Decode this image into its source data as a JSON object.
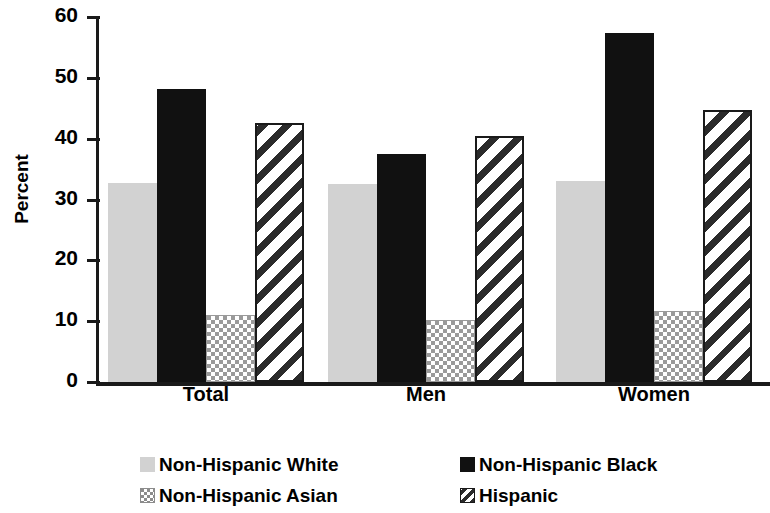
{
  "chart_data": {
    "type": "bar",
    "title": "",
    "xlabel": "",
    "ylabel": "Percent",
    "ylim": [
      0,
      60
    ],
    "yticks": [
      0,
      10,
      20,
      30,
      40,
      50,
      60
    ],
    "ytick_labels": [
      "0",
      "10",
      "20",
      "30",
      "40",
      "50",
      "60"
    ],
    "categories": [
      "Total",
      "Men",
      "Women"
    ],
    "grid": false,
    "legend_position": "bottom",
    "series": [
      {
        "name": "Non-Hispanic White",
        "key": "s-white",
        "swatch": "light-gray-solid",
        "color": "#d2d2d2",
        "values": [
          32.7,
          32.5,
          33.0
        ]
      },
      {
        "name": "Non-Hispanic Black",
        "key": "s-black",
        "swatch": "black-solid",
        "color": "#111111",
        "values": [
          48.2,
          37.4,
          57.4
        ]
      },
      {
        "name": "Non-Hispanic Asian",
        "key": "s-asian",
        "swatch": "checkerboard",
        "color": "#9a9a9a",
        "values": [
          11.0,
          10.2,
          11.7
        ]
      },
      {
        "name": "Hispanic",
        "key": "s-hisp",
        "swatch": "diagonal-hatch",
        "color": "#2b2b2b",
        "values": [
          42.6,
          40.4,
          44.7
        ]
      }
    ]
  },
  "axis": {
    "y_title": "Percent",
    "y_tick_labels": [
      "60",
      "50",
      "40",
      "30",
      "20",
      "10",
      "0"
    ]
  },
  "groups": [
    {
      "label": "Total"
    },
    {
      "label": "Men"
    },
    {
      "label": "Women"
    }
  ],
  "legend": {
    "items": [
      {
        "label": "Non-Hispanic White",
        "style": "s-white"
      },
      {
        "label": "Non-Hispanic Black",
        "style": "s-black"
      },
      {
        "label": "Non-Hispanic Asian",
        "style": "s-asian"
      },
      {
        "label": "Hispanic",
        "style": "s-hisp"
      }
    ]
  }
}
